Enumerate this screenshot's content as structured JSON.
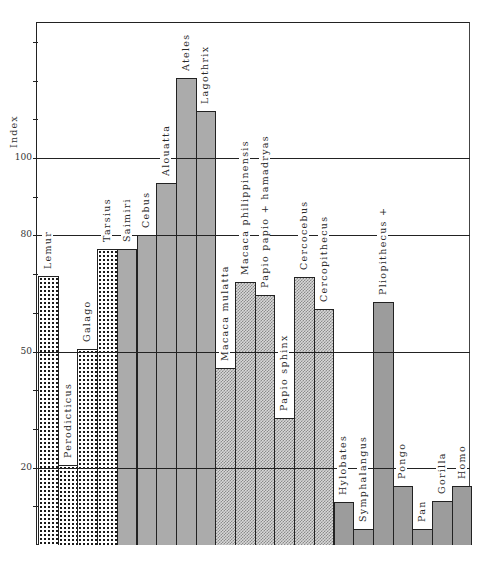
{
  "chart_data": {
    "type": "bar",
    "title": "",
    "xlabel": "",
    "ylabel": "Index",
    "ylim": [
      0,
      136
    ],
    "yticks_labeled": [
      20,
      50,
      80,
      100
    ],
    "ytick_labels": [
      "20",
      "50",
      "80",
      "100"
    ],
    "minor_tick_step": 10,
    "grid": "horizontal lines at 20, 50, 80, 100",
    "legend": "none (groups distinguished by fill pattern)",
    "categories": [
      "Lemur",
      "Perodicticus",
      "Galago",
      "Tarsius",
      "Saimiri",
      "Cebus",
      "Alouatta",
      "Ateles",
      "Lagothrix",
      "Macaca mulatta",
      "Macaca philippinensis",
      "Papio papio + hamadryas",
      "Papio sphinx",
      "Cercocebus",
      "Cercopithecus",
      "Hylobates",
      "Symphalangus",
      "Pliopithecus +",
      "Pongo",
      "Pan",
      "Gorilla",
      "Homo"
    ],
    "values": [
      69.5,
      20.7,
      50.6,
      76.5,
      76.5,
      80.1,
      93.5,
      120.7,
      112.1,
      45.7,
      68.0,
      64.6,
      32.8,
      69.3,
      61.0,
      11.1,
      4.1,
      62.8,
      15.2,
      4.1,
      11.4,
      15.2
    ],
    "groups": [
      {
        "name": "prosimians",
        "pattern": "dots",
        "members": [
          "Lemur",
          "Perodicticus",
          "Galago",
          "Tarsius"
        ]
      },
      {
        "name": "new-world-monkeys",
        "pattern": "gray",
        "members": [
          "Saimiri",
          "Cebus",
          "Alouatta",
          "Ateles",
          "Lagothrix"
        ]
      },
      {
        "name": "old-world-monkeys",
        "pattern": "checker",
        "members": [
          "Macaca mulatta",
          "Macaca philippinensis",
          "Papio papio + hamadryas",
          "Papio sphinx",
          "Cercocebus",
          "Cercopithecus"
        ]
      },
      {
        "name": "apes-and-man",
        "pattern": "dark",
        "members": [
          "Hylobates",
          "Symphalangus",
          "Pliopithecus +",
          "Pongo",
          "Pan",
          "Gorilla",
          "Homo"
        ]
      }
    ]
  },
  "axis": {
    "title": "Index",
    "labels": [
      {
        "value": 100,
        "text": "100"
      },
      {
        "value": 80,
        "text": "80"
      },
      {
        "value": 50,
        "text": "50"
      },
      {
        "value": 20,
        "text": "20"
      }
    ]
  },
  "bars": [
    {
      "label": "Lemur",
      "value": 69.5,
      "pattern": "dots"
    },
    {
      "label": "Perodicticus",
      "value": 20.7,
      "pattern": "dots"
    },
    {
      "label": "Galago",
      "value": 50.6,
      "pattern": "dots"
    },
    {
      "label": "Tarsius",
      "value": 76.5,
      "pattern": "dots"
    },
    {
      "label": "Saimiri",
      "value": 76.5,
      "pattern": "gray"
    },
    {
      "label": "Cebus",
      "value": 80.1,
      "pattern": "gray"
    },
    {
      "label": "Alouatta",
      "value": 93.5,
      "pattern": "gray"
    },
    {
      "label": "Ateles",
      "value": 120.7,
      "pattern": "gray"
    },
    {
      "label": "Lagothrix",
      "value": 112.1,
      "pattern": "gray"
    },
    {
      "label": "Macaca mulatta",
      "value": 45.7,
      "pattern": "check"
    },
    {
      "label": "Macaca philippinensis",
      "value": 68.0,
      "pattern": "check"
    },
    {
      "label": "Papio papio + hamadryas",
      "value": 64.6,
      "pattern": "check"
    },
    {
      "label": "Papio sphinx",
      "value": 32.8,
      "pattern": "check"
    },
    {
      "label": "Cercocebus",
      "value": 69.3,
      "pattern": "check"
    },
    {
      "label": "Cercopithecus",
      "value": 61.0,
      "pattern": "check"
    },
    {
      "label": "Hylobates",
      "value": 11.1,
      "pattern": "dark"
    },
    {
      "label": "Symphalangus",
      "value": 4.1,
      "pattern": "dark"
    },
    {
      "label": "Pliopithecus +",
      "value": 62.8,
      "pattern": "dark"
    },
    {
      "label": "Pongo",
      "value": 15.2,
      "pattern": "dark"
    },
    {
      "label": "Pan",
      "value": 4.1,
      "pattern": "dark"
    },
    {
      "label": "Gorilla",
      "value": 11.4,
      "pattern": "dark"
    },
    {
      "label": "Homo",
      "value": 15.2,
      "pattern": "dark"
    }
  ]
}
